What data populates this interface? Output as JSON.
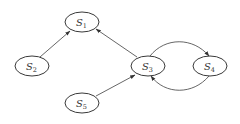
{
  "diagram": {
    "type": "directed-graph",
    "colors": {
      "stroke": "#3a3a3a",
      "edge": "#555555",
      "text": "#333333",
      "background": "#ffffff"
    },
    "nodes": [
      {
        "id": "S1",
        "base": "S",
        "sub": "1",
        "cx": 82,
        "cy": 22
      },
      {
        "id": "S2",
        "base": "S",
        "sub": "2",
        "cx": 32,
        "cy": 66
      },
      {
        "id": "S3",
        "base": "S",
        "sub": "3",
        "cx": 148,
        "cy": 66
      },
      {
        "id": "S4",
        "base": "S",
        "sub": "4",
        "cx": 210,
        "cy": 66
      },
      {
        "id": "S5",
        "base": "S",
        "sub": "5",
        "cx": 82,
        "cy": 103
      }
    ],
    "edges": [
      {
        "from": "S2",
        "to": "S1",
        "shape": "straight"
      },
      {
        "from": "S3",
        "to": "S1",
        "shape": "straight"
      },
      {
        "from": "S5",
        "to": "S3",
        "shape": "straight"
      },
      {
        "from": "S3",
        "to": "S4",
        "shape": "curved-top"
      },
      {
        "from": "S4",
        "to": "S3",
        "shape": "curved-bottom"
      }
    ]
  }
}
